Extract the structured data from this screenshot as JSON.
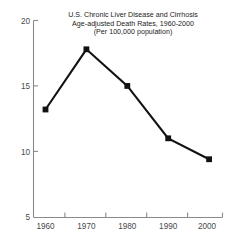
{
  "chart_data": {
    "type": "line",
    "title": "U.S. Chronic Liver Disease and Cirrhosis Age-adjusted Death Rates, 1960-2000 (Per 100,000 population)",
    "title_lines": [
      "U.S. Chronic Liver Disease and Cirrhosis",
      "Age-adjusted Death Rates, 1960-2000",
      "(Per 100,000 population)"
    ],
    "xlabel": "",
    "ylabel": "",
    "x": [
      1960,
      1970,
      1980,
      1990,
      2000
    ],
    "categories": [
      "1960",
      "1970",
      "1980",
      "1990",
      "2000"
    ],
    "values": [
      13.2,
      17.8,
      15.0,
      11.0,
      9.4
    ],
    "series": [
      {
        "name": "Age-adjusted death rate per 100,000 population",
        "values": [
          13.2,
          17.8,
          15.0,
          11.0,
          9.4
        ]
      }
    ],
    "xlim": [
      1955,
      2005
    ],
    "ylim": [
      5,
      20
    ],
    "ytick_labels": [
      "20",
      "15",
      "10",
      "5"
    ],
    "ytick_values": [
      20,
      15,
      10,
      5
    ],
    "xtick_labels": [
      "1960",
      "1970",
      "1980",
      "1990",
      "2000"
    ],
    "xtick_values": [
      1960,
      1970,
      1980,
      1990,
      2000
    ],
    "grid": false,
    "legend": "none",
    "marker": "square",
    "line_color": "#121212",
    "marker_color": "#121212",
    "axis_color": "#8a8a8a",
    "tick_label_color": "#4a4a4a",
    "background_color": "#ffffff"
  }
}
